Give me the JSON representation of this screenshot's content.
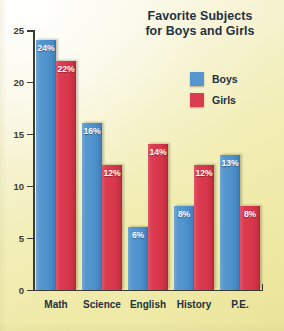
{
  "chart_data": {
    "type": "bar",
    "title": "Favorite Subjects for Boys and Girls",
    "title_line1": "Favorite Subjects",
    "title_line2": "for Boys and Girls",
    "xlabel": "",
    "ylabel": "",
    "ylim": [
      0,
      25
    ],
    "yticks": [
      0,
      5,
      10,
      15,
      20,
      25
    ],
    "ytick_labels": [
      "0",
      "5",
      "10",
      "15",
      "20",
      "25"
    ],
    "grid": false,
    "legend_position": "upper right",
    "value_label_suffix": "%",
    "categories": [
      "Math",
      "Science",
      "English",
      "History",
      "P.E."
    ],
    "series": [
      {
        "name": "Boys",
        "color": "#5596ce",
        "values": [
          24,
          16,
          6,
          8,
          13
        ],
        "labels": [
          "24%",
          "16%",
          "6%",
          "8%",
          "13%"
        ]
      },
      {
        "name": "Girls",
        "color": "#dc3c50",
        "values": [
          22,
          12,
          14,
          12,
          8
        ],
        "labels": [
          "22%",
          "12%",
          "14%",
          "12%",
          "8%"
        ]
      }
    ]
  },
  "colors": {
    "boys": "#5596ce",
    "girls": "#dc3c50",
    "axis": "#3c3c32",
    "text": "#22303f",
    "background": "#f2eeb8"
  }
}
